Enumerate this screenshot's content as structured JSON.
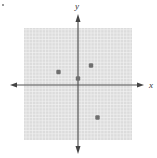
{
  "chart_data": {
    "type": "scatter",
    "title": "",
    "xlabel": "x",
    "ylabel": "y",
    "xlim": [
      -12,
      12
    ],
    "ylim": [
      -10,
      10
    ],
    "grid": true,
    "points": [
      {
        "x": -3,
        "y": 2
      },
      {
        "x": 2,
        "y": 3
      },
      {
        "x": 0,
        "y": 1
      },
      {
        "x": 3,
        "y": -5
      }
    ]
  },
  "colors": {
    "grid_bg": "#dcdcdc",
    "grid_line": "#f4f4f4",
    "axis": "#555555",
    "point": "#707070"
  }
}
